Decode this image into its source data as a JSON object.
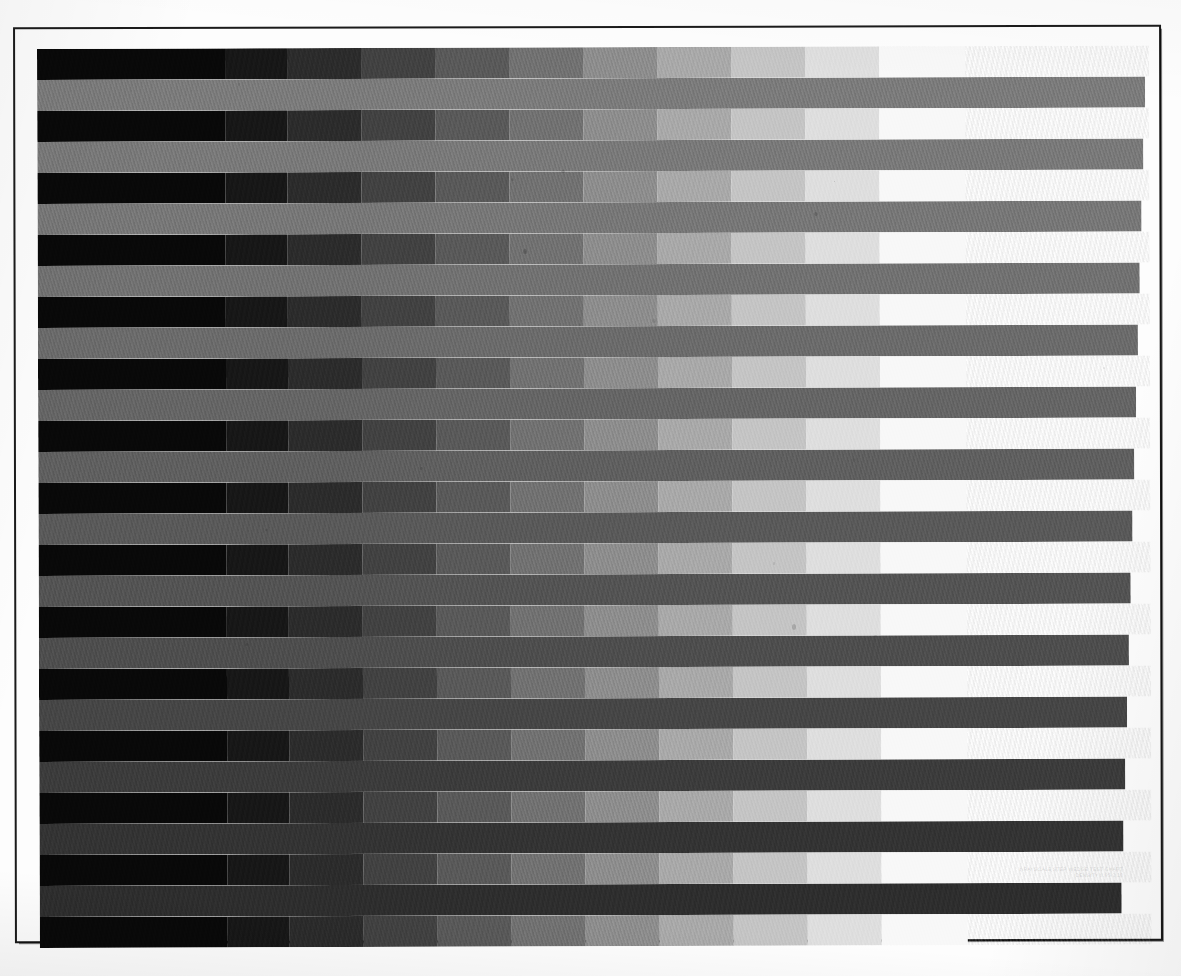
{
  "document": {
    "title": "Grayscale Step Wedge Calibration Target",
    "media": "scanned print test page",
    "background_color": "#fdfdfd",
    "frame_color": "#1b1b1b"
  },
  "legend": {
    "line1": "GRAYSCALE STEP WEDGE TEST CHART",
    "line2": "DENSITY 0.05-2.10"
  },
  "chart_data": {
    "type": "heatmap",
    "subtitle": "Alternating 11-step reflectance wedges and uniform density patches",
    "xlabel": "",
    "ylabel": "",
    "grid": false,
    "legend_position": "none",
    "orientation": "horizontal-bands",
    "geometry": {
      "page_width": 1181,
      "page_height": 976,
      "frame_left": 14,
      "frame_top": 26,
      "frame_width": 1148,
      "frame_height": 916,
      "stack_left": 37,
      "stack_top": 49,
      "stack_width": 1112,
      "row_height": 31,
      "row_pitch": 30.1,
      "skew_degrees": -0.18
    },
    "wedge_steps": {
      "count": 11,
      "label": "11-step reflectance wedge, black to paper white",
      "step_widths": [
        188,
        62,
        74,
        74,
        74,
        74,
        74,
        74,
        74,
        74,
        86
      ],
      "gray_values": [
        8,
        22,
        42,
        64,
        88,
        112,
        140,
        168,
        196,
        222,
        248
      ],
      "gray_hex": [
        "#080808",
        "#161616",
        "#2a2a2a",
        "#404040",
        "#585858",
        "#707070",
        "#8c8c8c",
        "#a8a8a8",
        "#c4c4c4",
        "#dedede",
        "#f8f8f8"
      ]
    },
    "categories": [
      "wedge-1",
      "band-1",
      "wedge-2",
      "band-2",
      "wedge-3",
      "band-3",
      "wedge-4",
      "band-4",
      "wedge-5",
      "band-5",
      "wedge-6",
      "band-6",
      "wedge-7",
      "band-7",
      "wedge-8",
      "band-8",
      "wedge-9",
      "band-9",
      "wedge-10",
      "band-10",
      "wedge-11",
      "band-11",
      "wedge-12",
      "band-12",
      "wedge-13",
      "band-13",
      "wedge-14",
      "band-14",
      "wedge-15"
    ],
    "rows": [
      {
        "index": 0,
        "kind": "wedge",
        "top": 0,
        "width": 1112,
        "gray": null,
        "note": "11-step wedge"
      },
      {
        "index": 1,
        "kind": "band",
        "top": 31,
        "width": 1108,
        "gray": 122,
        "hex": "#7a7a7a"
      },
      {
        "index": 2,
        "kind": "wedge",
        "top": 62,
        "width": 1112,
        "gray": null,
        "note": "11-step wedge"
      },
      {
        "index": 3,
        "kind": "band",
        "top": 93,
        "width": 1106,
        "gray": 120,
        "hex": "#787878"
      },
      {
        "index": 4,
        "kind": "wedge",
        "top": 124,
        "width": 1112,
        "gray": null,
        "note": "11-step wedge"
      },
      {
        "index": 5,
        "kind": "band",
        "top": 155,
        "width": 1104,
        "gray": 118,
        "hex": "#767676"
      },
      {
        "index": 6,
        "kind": "wedge",
        "top": 186,
        "width": 1112,
        "gray": null,
        "note": "11-step wedge"
      },
      {
        "index": 7,
        "kind": "band",
        "top": 217,
        "width": 1102,
        "gray": 112,
        "hex": "#707070"
      },
      {
        "index": 8,
        "kind": "wedge",
        "top": 248,
        "width": 1112,
        "gray": null,
        "note": "11-step wedge"
      },
      {
        "index": 9,
        "kind": "band",
        "top": 279,
        "width": 1100,
        "gray": 106,
        "hex": "#6a6a6a"
      },
      {
        "index": 10,
        "kind": "wedge",
        "top": 310,
        "width": 1112,
        "gray": null,
        "note": "11-step wedge"
      },
      {
        "index": 11,
        "kind": "band",
        "top": 341,
        "width": 1098,
        "gray": 100,
        "hex": "#646464"
      },
      {
        "index": 12,
        "kind": "wedge",
        "top": 372,
        "width": 1112,
        "gray": null,
        "note": "11-step wedge"
      },
      {
        "index": 13,
        "kind": "band",
        "top": 403,
        "width": 1096,
        "gray": 94,
        "hex": "#5e5e5e"
      },
      {
        "index": 14,
        "kind": "wedge",
        "top": 434,
        "width": 1112,
        "gray": null,
        "note": "11-step wedge"
      },
      {
        "index": 15,
        "kind": "band",
        "top": 465,
        "width": 1094,
        "gray": 88,
        "hex": "#585858"
      },
      {
        "index": 16,
        "kind": "wedge",
        "top": 496,
        "width": 1112,
        "gray": null,
        "note": "11-step wedge"
      },
      {
        "index": 17,
        "kind": "band",
        "top": 527,
        "width": 1092,
        "gray": 82,
        "hex": "#525252"
      },
      {
        "index": 18,
        "kind": "wedge",
        "top": 558,
        "width": 1112,
        "gray": null,
        "note": "11-step wedge"
      },
      {
        "index": 19,
        "kind": "band",
        "top": 589,
        "width": 1090,
        "gray": 76,
        "hex": "#4c4c4c"
      },
      {
        "index": 20,
        "kind": "wedge",
        "top": 620,
        "width": 1112,
        "gray": null,
        "note": "11-step wedge"
      },
      {
        "index": 21,
        "kind": "band",
        "top": 651,
        "width": 1088,
        "gray": 68,
        "hex": "#444444"
      },
      {
        "index": 22,
        "kind": "wedge",
        "top": 682,
        "width": 1112,
        "gray": null,
        "note": "11-step wedge"
      },
      {
        "index": 23,
        "kind": "band",
        "top": 713,
        "width": 1086,
        "gray": 58,
        "hex": "#3a3a3a"
      },
      {
        "index": 24,
        "kind": "wedge",
        "top": 744,
        "width": 1112,
        "gray": null,
        "note": "11-step wedge"
      },
      {
        "index": 25,
        "kind": "band",
        "top": 775,
        "width": 1084,
        "gray": 50,
        "hex": "#323232"
      },
      {
        "index": 26,
        "kind": "wedge",
        "top": 806,
        "width": 1112,
        "gray": null,
        "note": "11-step wedge"
      },
      {
        "index": 27,
        "kind": "band",
        "top": 837,
        "width": 1082,
        "gray": 44,
        "hex": "#2c2c2c"
      },
      {
        "index": 28,
        "kind": "wedge",
        "top": 868,
        "width": 1112,
        "gray": null,
        "note": "11-step wedge"
      }
    ]
  }
}
